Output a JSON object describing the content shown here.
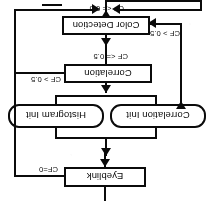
{
  "diagram": {
    "orientation_note": "rendered upside-down (180 degrees)",
    "nodes": [
      {
        "id": "color_detection",
        "label": "Color Detection",
        "shape": "rect"
      },
      {
        "id": "correlation",
        "label": "Correlation",
        "shape": "rect"
      },
      {
        "id": "correlation_init",
        "label": "Correlation Init",
        "shape": "rounded"
      },
      {
        "id": "histogram_init",
        "label": "Histogram Init",
        "shape": "rounded"
      },
      {
        "id": "eyeblink",
        "label": "Eyeblink",
        "shape": "rect"
      }
    ],
    "edge_labels": {
      "color_detection_out": "CF <= 0.5",
      "color_detection_back": "CF > 0.5",
      "correlation_out": "CF <= 0.5",
      "correlation_back": "CF > 0.5",
      "eyeblink_out": "CF=0"
    },
    "colors": {
      "stroke": "#111111",
      "fill": "#ffffff",
      "text": "#0a0a0a",
      "page": "#fdfdfd"
    }
  }
}
